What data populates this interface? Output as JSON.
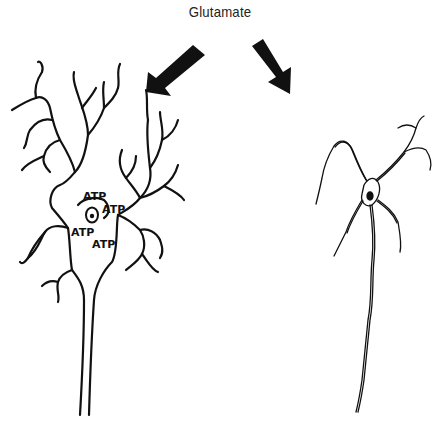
{
  "diagram": {
    "title": "Glutamate",
    "colors": {
      "ink": "#111111",
      "background": "#ffffff"
    },
    "arrows": [
      {
        "id": "arrow-left",
        "direction": "down-left",
        "target": "healthy-neuron"
      },
      {
        "id": "arrow-right",
        "direction": "down-right",
        "target": "damaged-neuron"
      }
    ],
    "neurons": [
      {
        "id": "healthy-neuron",
        "position": "left",
        "style": "smooth outlined dendrites, thick axon",
        "labels": [
          "ATP",
          "ATP",
          "ATP",
          "ATP"
        ]
      },
      {
        "id": "damaged-neuron",
        "position": "right",
        "style": "thin, shriveled, beaded dendrites and axon"
      }
    ]
  }
}
